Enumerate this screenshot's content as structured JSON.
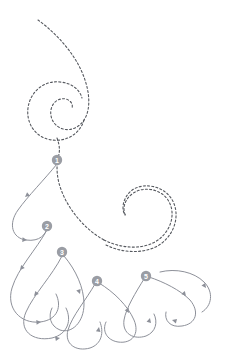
{
  "canvas": {
    "width": 225,
    "height": 357,
    "background": "#ffffff"
  },
  "style": {
    "dashed_stroke": "#55585e",
    "solid_stroke": "#8d9099",
    "marker_fill": "#9a9da4",
    "marker_label_fill": "#ffffff",
    "dashed_width": 1.1,
    "solid_width": 1.0,
    "dash_pattern": "2,2.2"
  },
  "chart_data": {
    "type": "trajectory",
    "title": "",
    "waypoints": [
      {
        "id": 1,
        "label": "1",
        "x": 57,
        "y": 160
      },
      {
        "id": 2,
        "label": "2",
        "x": 47,
        "y": 226
      },
      {
        "id": 3,
        "label": "3",
        "x": 62,
        "y": 252
      },
      {
        "id": 4,
        "label": "4",
        "x": 97,
        "y": 281
      },
      {
        "id": 5,
        "label": "5",
        "x": 146,
        "y": 276
      }
    ],
    "dashed_paths": [
      {
        "name": "upper-spiral-inflow",
        "d": "M 38 20 C 52 30 68 46 78 64 C 90 86 92 108 84 120 C 76 132 62 132 55 124 C 48 116 50 104 58 100 C 66 96 74 102 72 108"
      },
      {
        "name": "upper-spiral-outer-turn",
        "d": "M 84 120 C 80 134 66 142 52 140 C 36 138 26 124 28 108 C 30 92 44 80 60 82 C 72 83 80 90 82 98"
      },
      {
        "name": "upper-spiral-descent",
        "d": "M 57 138 C 60 146 60 152 58 158 C 56 168 57 180 62 192 C 70 212 86 230 104 240"
      },
      {
        "name": "right-hook-outer",
        "d": "M 104 240 C 122 249 144 250 158 240 C 172 230 176 212 168 200 C 160 188 142 186 132 194 C 124 200 122 210 126 216"
      },
      {
        "name": "right-hook-inner",
        "d": "M 106 245 C 124 254 148 254 162 243 C 177 231 180 211 171 198 C 162 185 142 182 131 191 C 123 198 121 209 125 215"
      }
    ],
    "solid_loops": [
      {
        "name": "loop-1-to-2",
        "from_waypoint": 1,
        "to_waypoint": 2,
        "d": "M 57 164 C 44 180 28 196 18 210 C 8 224 12 238 26 240 C 40 242 46 234 47 228",
        "arrows": [
          {
            "x": 25,
            "y": 197,
            "angle": 140
          },
          {
            "x": 27,
            "y": 240,
            "angle": 5
          }
        ]
      },
      {
        "name": "loop-2-lower",
        "from_waypoint": 2,
        "to_waypoint": 2,
        "d": "M 47 230 C 36 250 18 268 12 288 C 6 308 20 324 40 322 C 58 320 62 306 56 294",
        "arrows": [
          {
            "x": 20,
            "y": 270,
            "angle": 130
          },
          {
            "x": 41,
            "y": 322,
            "angle": 355
          }
        ]
      },
      {
        "name": "loop-3-to-left",
        "from_waypoint": 3,
        "to_waypoint": 3,
        "d": "M 62 256 C 52 276 34 294 26 312 C 18 330 32 342 52 338 C 68 334 72 320 66 308",
        "arrows": [
          {
            "x": 34,
            "y": 296,
            "angle": 132
          },
          {
            "x": 60,
            "y": 338,
            "angle": 350
          }
        ]
      },
      {
        "name": "loop-3-right",
        "from_waypoint": 3,
        "to_waypoint": 3,
        "d": "M 64 256 C 76 270 84 288 84 304 C 84 322 72 334 60 330 C 50 326 48 316 52 308",
        "arrows": [
          {
            "x": 80,
            "y": 294,
            "angle": 70
          }
        ]
      },
      {
        "name": "loop-4-left",
        "from_waypoint": 4,
        "to_waypoint": 4,
        "d": "M 95 284 C 86 300 72 316 68 330 C 64 344 76 352 90 348 C 102 344 104 332 100 322",
        "arrows": [
          {
            "x": 99,
            "y": 327,
            "angle": 280
          }
        ]
      },
      {
        "name": "loop-4-right",
        "from_waypoint": 4,
        "to_waypoint": 5,
        "d": "M 99 283 C 114 292 128 306 134 320 C 140 334 132 344 118 342 C 106 340 102 330 106 322",
        "arrows": [
          {
            "x": 129,
            "y": 313,
            "angle": 60
          }
        ]
      },
      {
        "name": "loop-5-left",
        "from_waypoint": 5,
        "to_waypoint": 5,
        "d": "M 144 279 C 136 292 126 308 124 320 C 122 334 134 340 146 336 C 156 332 158 322 154 314",
        "arrows": [
          {
            "x": 150,
            "y": 318,
            "angle": 285
          }
        ]
      },
      {
        "name": "loop-5-right",
        "from_waypoint": 5,
        "to_waypoint": 5,
        "d": "M 149 277 C 164 282 180 290 190 300 C 200 312 196 324 182 326 C 170 328 164 320 166 312",
        "arrows": [
          {
            "x": 186,
            "y": 296,
            "angle": 50
          },
          {
            "x": 172,
            "y": 320,
            "angle": 195
          }
        ]
      },
      {
        "name": "loop-5-upper-arc",
        "from_waypoint": 5,
        "to_waypoint": 5,
        "d": "M 160 272 C 176 268 194 272 204 282 C 214 292 212 306 202 312",
        "arrows": [
          {
            "x": 206,
            "y": 288,
            "angle": 55
          }
        ]
      }
    ]
  }
}
